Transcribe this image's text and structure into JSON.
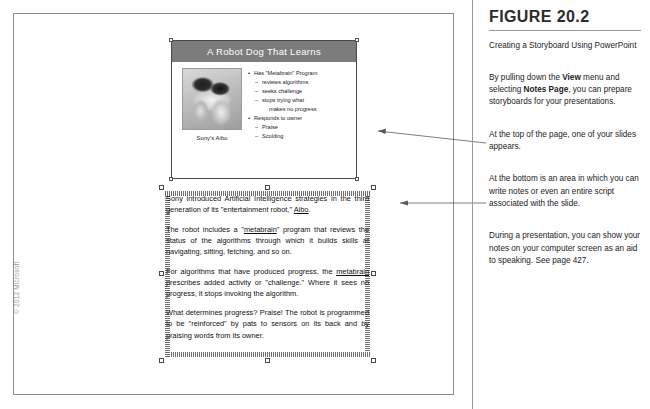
{
  "figure": {
    "number": "FIGURE 20.2",
    "caption": "Creating a Storyboard Using PowerPoint",
    "callouts": [
      {
        "id": "view-menu",
        "text_parts": [
          {
            "text": "By pulling down the ",
            "bold": false
          },
          {
            "text": "View",
            "bold": true
          },
          {
            "text": " menu and selecting ",
            "bold": false
          },
          {
            "text": "Notes Page",
            "bold": true
          },
          {
            "text": ", you can prepare storyboards for your presentations.",
            "bold": false
          }
        ],
        "plain": "By pulling down the View menu and selecting Notes Page, you can prepare storyboards for your presentations."
      },
      {
        "id": "top-of-page",
        "plain": "At the top of the page, one of your slides appears."
      },
      {
        "id": "bottom-area",
        "plain": "At the bottom is an area in which you can write notes or even an entire script associated with the slide."
      },
      {
        "id": "presentation-aid",
        "plain": "During a presentation, you can show your notes on your computer screen as an aid to speaking. See page 427."
      }
    ]
  },
  "page": {
    "copyright": "© 2012 Microsoft"
  },
  "slide": {
    "title": "A Robot  Dog That Learns",
    "image_caption": "Sony's Aibo",
    "image_alt": "aibo-robot-dog-photo",
    "bullets": [
      {
        "level": 1,
        "text": "Has \"Metabrain\" Program"
      },
      {
        "level": 2,
        "text": "reviews algorithms"
      },
      {
        "level": 2,
        "text": "seeks challenge"
      },
      {
        "level": 2,
        "text": "stops trying what"
      },
      {
        "level": 3,
        "text": "makes no progress"
      },
      {
        "level": 1,
        "text": "Responds to owner"
      },
      {
        "level": 2,
        "text": "Praise"
      },
      {
        "level": 2,
        "text": "Scolding"
      }
    ]
  },
  "notes": {
    "paragraphs": [
      {
        "id": "p1",
        "html": "Sony introduced Artificial Intelligence strategies in the third generation of its \"entertainment robot,\" <u>Aibo</u>.",
        "plain": "Sony introduced Artificial Intelligence strategies in the third generation of its \"entertainment robot,\" Aibo."
      },
      {
        "id": "p2",
        "html": "The robot includes a \"<u>metabrain</u>\" program that reviews the status of the algorithms through which it  builds skills at navigating, sitting, fetching, and so on.",
        "plain": "The robot includes a \"metabrain\" program that reviews the status of the algorithms through which it builds skills at navigating, sitting, fetching, and so on."
      },
      {
        "id": "p3",
        "html": "For algorithms that have produced progress, the <u>metabrain</u> prescribes added activity or \"challenge.\" Where it sees no progress, it stops invoking the algorithm.",
        "plain": "For algorithms that have produced progress, the metabrain prescribes added activity or \"challenge.\" Where it sees no progress, it stops invoking the algorithm."
      },
      {
        "id": "p4",
        "html": "What determines progress? Praise! The robot is programmed to be \"reinforced\" by pats to sensors on its back and by praising words from its owner.",
        "plain": "What determines progress? Praise! The robot is programmed to be \"reinforced\" by pats to sensors on its back and by praising words from its owner."
      }
    ]
  },
  "colors": {
    "slide_title_bar": "#7c7c7c",
    "page_border": "#8d8d8d",
    "rail": "#9a9a9a",
    "text": "#1c1c1c",
    "copyright": "#9a9a9a"
  }
}
